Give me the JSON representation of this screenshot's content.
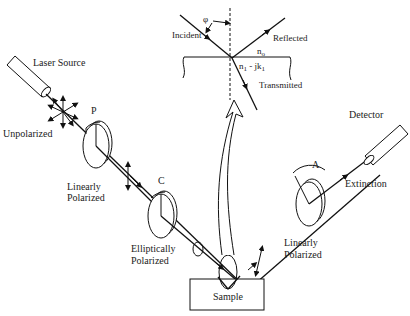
{
  "diagram": {
    "type": "ellipsometer-schematic",
    "components": {
      "laser_source": "Laser Source",
      "polarizer": "P",
      "compensator": "C",
      "analyzer": "A",
      "detector": "Detector",
      "sample": "Sample"
    },
    "states": {
      "unpolarized": "Unpolarized",
      "linearly_polarized_1_line1": "Linearly",
      "linearly_polarized_1_line2": "Polarized",
      "elliptically_line1": "Elliptically",
      "elliptically_line2": "Polarized",
      "linearly_polarized_2_line1": "Linearly",
      "linearly_polarized_2_line2": "Polarized",
      "extinction": "Extinction"
    },
    "inset": {
      "angle": "φ",
      "incident": "Incident",
      "reflected": "Reflected",
      "transmitted": "Transmitted",
      "n0_main": "n",
      "n0_sub": "o",
      "n1_main": "n",
      "n1_sub": "1",
      "n1_mid": " - jk",
      "k1_sub": "1"
    }
  }
}
